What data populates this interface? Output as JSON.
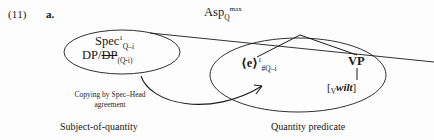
{
  "example": {
    "number": "(11)",
    "letter": "a."
  },
  "diagram": {
    "type": "syntactic-tree-with-ellipses",
    "top_projection": {
      "base": "Asp",
      "subscript": "Q",
      "superscript": "max",
      "full": "AspQmax"
    },
    "left_ellipse": {
      "region_label": "Subject-of-quantity",
      "nodes": [
        {
          "name": "spec-node",
          "base": "Spec",
          "superscript": "1",
          "subscript": "Q–i"
        },
        {
          "name": "dp-node",
          "first": "DP",
          "separator": "/",
          "second_struck": "DP",
          "subscript": "(Q-i)"
        }
      ]
    },
    "right_ellipse": {
      "region_label": "Quantity predicate",
      "nodes": [
        {
          "name": "empty-category-node",
          "base": "⟨e⟩",
          "superscript": "1",
          "subscript": "#Q–i"
        },
        {
          "name": "vp-node",
          "base": "VP"
        },
        {
          "name": "verb-node",
          "open_bracket": "[",
          "category_subscript": "V",
          "word": "wilt",
          "close_bracket": "]"
        }
      ]
    },
    "annotation": {
      "name": "copying-annotation",
      "text": "Copying by Spec–Head\nagreement"
    },
    "colors": {
      "ink": "#181818",
      "page": "#fdfdfd",
      "line": "#1a1a1a"
    }
  }
}
